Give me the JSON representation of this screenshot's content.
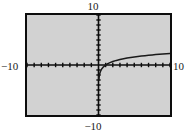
{
  "figure": {
    "kind": "graphing-calculator-viewport",
    "title": "",
    "background_color": "#ffffff",
    "plot_background_color": "#d2d2d2",
    "frame_color": "#0d0d0d",
    "axis_color": "#0d0d0d",
    "curve_color": "#1a1a1a"
  },
  "labels": {
    "top": "10",
    "bottom": "−10",
    "left": "−10",
    "right": "10"
  },
  "chart_data": {
    "type": "line",
    "title": "",
    "xlabel": "",
    "ylabel": "",
    "xlim": [
      -10,
      10
    ],
    "ylim": [
      -10,
      10
    ],
    "xtick_step": 1,
    "ytick_step": 1,
    "grid": false,
    "legend": "none",
    "tick_labels_x": [
      "-10",
      "10"
    ],
    "tick_labels_y": [
      "-10",
      "10"
    ],
    "annotations": [],
    "series": [
      {
        "name": "y = ln(x)",
        "domain": [
          0,
          10
        ],
        "asymptote_x": 0,
        "x": [
          0.05,
          0.1,
          0.15,
          0.2,
          0.3,
          0.4,
          0.5,
          0.7,
          1.0,
          1.3,
          1.6,
          2.0,
          2.5,
          3.0,
          3.5,
          4.0,
          4.5,
          5.0,
          5.5,
          6.0,
          6.5,
          7.0,
          7.5,
          8.0,
          8.5,
          9.0,
          9.5,
          10.0
        ],
        "y": [
          -3.0,
          -2.3,
          -1.9,
          -1.61,
          -1.2,
          -0.92,
          -0.69,
          -0.36,
          0.0,
          0.26,
          0.47,
          0.69,
          0.92,
          1.1,
          1.25,
          1.39,
          1.5,
          1.61,
          1.7,
          1.79,
          1.87,
          1.95,
          2.01,
          2.08,
          2.14,
          2.2,
          2.25,
          2.3
        ]
      }
    ]
  }
}
